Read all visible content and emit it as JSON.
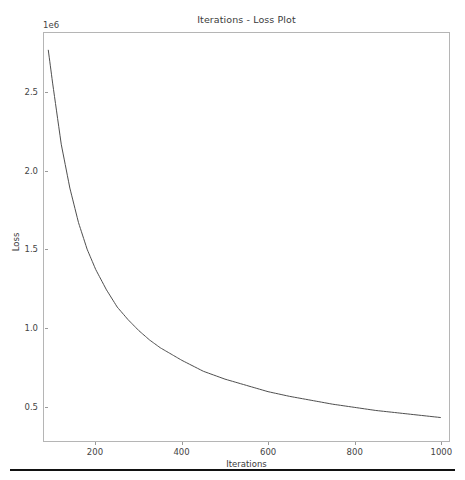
{
  "chart_data": {
    "type": "line",
    "title": "Iterations - Loss Plot",
    "xlabel": "Iterations",
    "ylabel": "Loss",
    "y_exponent_label": "1e6",
    "y_scale_factor": 1000000,
    "grid": false,
    "legend": null,
    "xlim": [
      80,
      1020
    ],
    "ylim": [
      275000,
      2880000
    ],
    "xticks": [
      200,
      400,
      600,
      800,
      1000
    ],
    "xtick_labels": [
      "200",
      "400",
      "600",
      "800",
      "1000"
    ],
    "yticks": [
      500000,
      1000000,
      1500000,
      2000000,
      2500000
    ],
    "ytick_labels": [
      "0.5",
      "1.0",
      "1.5",
      "2.0",
      "2.5"
    ],
    "line_color": "#4d4d4d",
    "line_width": 1.0,
    "series": [
      {
        "name": "loss",
        "x": [
          90,
          100,
          120,
          140,
          160,
          180,
          200,
          225,
          250,
          275,
          300,
          325,
          350,
          375,
          400,
          450,
          500,
          550,
          600,
          650,
          700,
          750,
          800,
          850,
          900,
          950,
          1000
        ],
        "values": [
          2770000,
          2560000,
          2170000,
          1890000,
          1670000,
          1500000,
          1370000,
          1240000,
          1130000,
          1050000,
          980000,
          920000,
          870000,
          830000,
          790000,
          720000,
          670000,
          630000,
          590000,
          560000,
          535000,
          510000,
          490000,
          470000,
          455000,
          440000,
          425000
        ]
      }
    ],
    "annotations": []
  },
  "figure": {
    "background_color": "#ffffff",
    "axes_border_color": "#b5b5b5",
    "bottom_rule_color": "#121212"
  }
}
